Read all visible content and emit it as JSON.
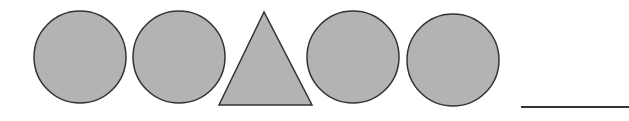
{
  "colors": {
    "background": "#ffffff",
    "shape_fill": "#b3b3b3",
    "shape_stroke": "#333333",
    "answer_line": "#333333"
  },
  "pattern": {
    "sequence": [
      "circle",
      "circle",
      "triangle",
      "circle",
      "circle"
    ],
    "answer_blank": "___"
  }
}
